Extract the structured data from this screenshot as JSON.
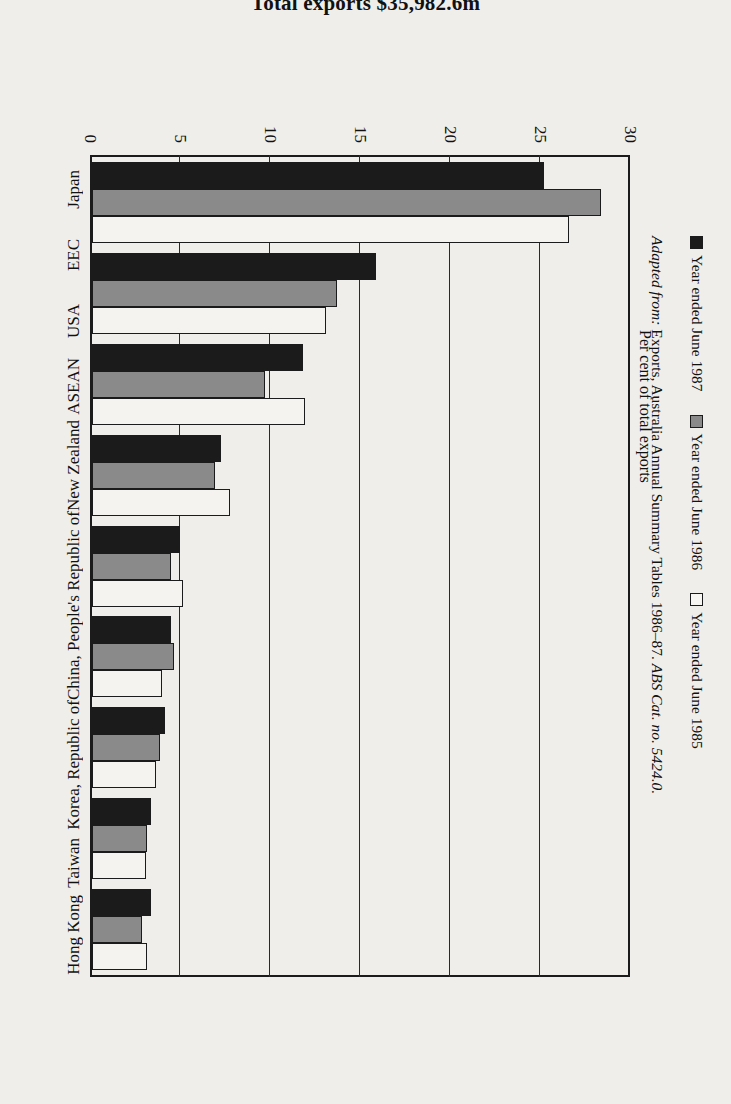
{
  "title": "Total exports $35,982.6m",
  "axis_title": "Per cent of total exports",
  "source": {
    "prefix": "Adapted from:",
    "text": "Exports, Australia Annual Summary Tables 1986–87.",
    "cite": "ABS Cat. no. 5424.0."
  },
  "legend": [
    {
      "label": "Year ended June 1987",
      "swatch": "black"
    },
    {
      "label": "Year ended June 1986",
      "swatch": "gray"
    },
    {
      "label": "Year ended June 1985",
      "swatch": "white"
    }
  ],
  "colors": {
    "series_1987": "#1b1b1b",
    "series_1986": "#8a8a8a",
    "series_1985": "#f4f3ef",
    "frame": "#1b1b1b",
    "page": "#efeeea"
  },
  "chart_data": {
    "type": "bar",
    "title": "Total exports $35,982.6m",
    "xlabel": "",
    "ylabel": "Per cent of total exports",
    "ylim": [
      0,
      30
    ],
    "yticks": [
      0,
      5,
      10,
      15,
      20,
      25,
      30
    ],
    "grid": true,
    "legend_position": "bottom",
    "orientation": "vertical-bars-rotated-page",
    "categories": [
      "Japan",
      "EEC",
      "USA",
      "ASEAN",
      "New Zealand",
      "China, People's Republic of",
      "Korea, Republic of",
      "Taiwan",
      "Hong Kong"
    ],
    "series": [
      {
        "name": "Year ended June 1987",
        "values": [
          25.3,
          15.9,
          11.8,
          7.2,
          4.9,
          4.4,
          4.1,
          3.3,
          3.3
        ]
      },
      {
        "name": "Year ended June 1986",
        "values": [
          28.5,
          13.7,
          9.7,
          6.9,
          4.4,
          4.6,
          3.8,
          3.1,
          2.8
        ]
      },
      {
        "name": "Year ended June 1985",
        "values": [
          26.7,
          13.1,
          11.9,
          7.7,
          5.1,
          3.9,
          3.6,
          3.0,
          3.1
        ]
      }
    ]
  }
}
